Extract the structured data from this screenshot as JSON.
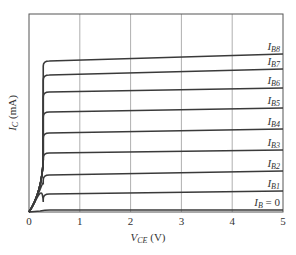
{
  "chart_data": {
    "type": "line",
    "title": "",
    "xlabel": "V_CE (V)",
    "ylabel": "I_C (mA)",
    "xlim": [
      0,
      5
    ],
    "ylim": [
      0,
      null
    ],
    "x_ticks": [
      "0",
      "1",
      "2",
      "3",
      "4",
      "5"
    ],
    "y_ticks": [],
    "grid": "vertical",
    "legend_position": "inline-right",
    "knee_vce": 0.3,
    "series": [
      {
        "name": "I_B = 0",
        "label_main": "I",
        "label_sub": "B",
        "label_suffix": " = 0",
        "y_start_px": 210,
        "y_end_px": 210
      },
      {
        "name": "I_B1",
        "label_main": "I",
        "label_sub": "B1",
        "label_suffix": "",
        "y_start_px": 194,
        "y_end_px": 191
      },
      {
        "name": "I_B2",
        "label_main": "I",
        "label_sub": "B2",
        "label_suffix": "",
        "y_start_px": 175,
        "y_end_px": 171
      },
      {
        "name": "I_B3",
        "label_main": "I",
        "label_sub": "B3",
        "label_suffix": "",
        "y_start_px": 153,
        "y_end_px": 150
      },
      {
        "name": "I_B4",
        "label_main": "I",
        "label_sub": "B4",
        "label_suffix": "",
        "y_start_px": 133,
        "y_end_px": 129
      },
      {
        "name": "I_B5",
        "label_main": "I",
        "label_sub": "B5",
        "label_suffix": "",
        "y_start_px": 112,
        "y_end_px": 108
      },
      {
        "name": "I_B6",
        "label_main": "I",
        "label_sub": "B6",
        "label_suffix": "",
        "y_start_px": 92,
        "y_end_px": 88
      },
      {
        "name": "I_B7",
        "label_main": "I",
        "label_sub": "B7",
        "label_suffix": "",
        "y_start_px": 75,
        "y_end_px": 69
      },
      {
        "name": "I_B8",
        "label_main": "I",
        "label_sub": "B8",
        "label_suffix": "",
        "y_start_px": 61,
        "y_end_px": 54
      }
    ]
  },
  "axes": {
    "x_label_main": "V",
    "x_label_sub": "CE",
    "x_label_unit": " (V)",
    "y_label_main": "I",
    "y_label_sub": "C",
    "y_label_unit": " (mA)"
  },
  "colors": {
    "curve": "#3a3a3a",
    "grid": "#9a9a9a",
    "frame": "#555555",
    "text": "#333333"
  }
}
